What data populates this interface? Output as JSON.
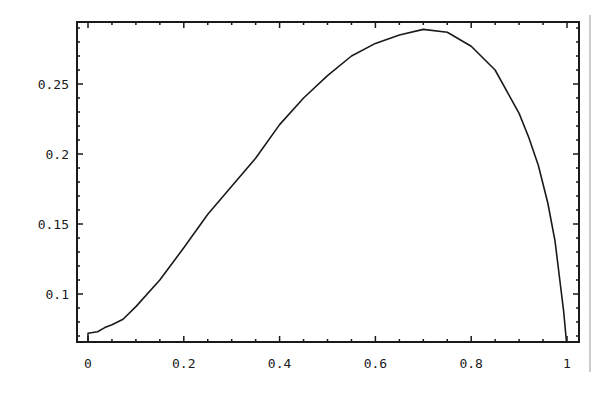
{
  "chart_data": {
    "type": "line",
    "title": "",
    "xlabel": "",
    "ylabel": "",
    "xlim": [
      -0.023,
      1.023
    ],
    "ylim": [
      0.0657,
      0.294
    ],
    "grid": false,
    "legend": null,
    "frame": true,
    "x_ticks": [
      {
        "value": 0,
        "label": "0"
      },
      {
        "value": 0.2,
        "label": "0.2"
      },
      {
        "value": 0.4,
        "label": "0.4"
      },
      {
        "value": 0.6,
        "label": "0.6"
      },
      {
        "value": 0.8,
        "label": "0.8"
      },
      {
        "value": 1,
        "label": "1"
      }
    ],
    "y_ticks": [
      {
        "value": 0.1,
        "label": "0.1"
      },
      {
        "value": 0.15,
        "label": "0.15"
      },
      {
        "value": 0.2,
        "label": "0.2"
      },
      {
        "value": 0.25,
        "label": "0.25"
      }
    ],
    "x_minor_step": 0.05,
    "y_minor_step": 0.01,
    "series": [
      {
        "name": "curve",
        "color": "#1a1a1a",
        "points": [
          [
            0,
            0.0657
          ],
          [
            0,
            0.072
          ],
          [
            0.02,
            0.073
          ],
          [
            0.035,
            0.076
          ],
          [
            0.05,
            0.078
          ],
          [
            0.073,
            0.082
          ],
          [
            0.1,
            0.091
          ],
          [
            0.15,
            0.11
          ],
          [
            0.2,
            0.133
          ],
          [
            0.25,
            0.157
          ],
          [
            0.3,
            0.177
          ],
          [
            0.35,
            0.197
          ],
          [
            0.4,
            0.221
          ],
          [
            0.45,
            0.24
          ],
          [
            0.5,
            0.256
          ],
          [
            0.55,
            0.27
          ],
          [
            0.6,
            0.279
          ],
          [
            0.65,
            0.285
          ],
          [
            0.7,
            0.289
          ],
          [
            0.75,
            0.287
          ],
          [
            0.8,
            0.277
          ],
          [
            0.85,
            0.26
          ],
          [
            0.9,
            0.229
          ],
          [
            0.92,
            0.212
          ],
          [
            0.94,
            0.192
          ],
          [
            0.96,
            0.165
          ],
          [
            0.975,
            0.138
          ],
          [
            0.985,
            0.11
          ],
          [
            0.993,
            0.088
          ],
          [
            0.999,
            0.0657
          ]
        ]
      }
    ]
  },
  "colors": {
    "frame": "#1a1a1a",
    "background": "#ffffff",
    "side_rule": "#9a9a9a"
  }
}
